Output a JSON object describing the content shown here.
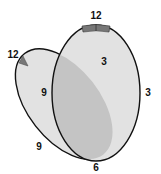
{
  "diagram": {
    "type": "two overlapping clock-face ellipses",
    "colors": {
      "background": "#ffffff",
      "face_fill": "#e2e2e2",
      "overlap_fill": "#c4c4c4",
      "outline": "#111111",
      "marker": "#777777"
    },
    "front_face": {
      "labels": {
        "top": "12",
        "right": "3",
        "bottom": "6",
        "left": "9"
      }
    },
    "back_face": {
      "labels": {
        "top": "12",
        "right": "3",
        "left": "9"
      }
    }
  }
}
